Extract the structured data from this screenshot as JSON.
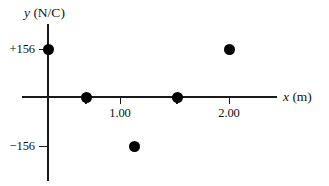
{
  "figure": {
    "background_color": "#ffffff",
    "ink_color": "#1a1a1a",
    "point_color": "#000000"
  },
  "axes": {
    "x_title_var": "x",
    "x_title_unit": " (m)",
    "y_title_var": "y",
    "y_title_unit": " (N/C)",
    "x_ticks": [
      {
        "label": "1.00",
        "value": 1.0,
        "px": 120
      },
      {
        "label": "2.00",
        "value": 2.0,
        "px": 229
      }
    ],
    "y_ticks": [
      {
        "label": "+156",
        "value": 156,
        "px": 49
      },
      {
        "label": "−156",
        "value": -156,
        "px": 146
      }
    ]
  },
  "chart_data": {
    "type": "scatter",
    "title": "",
    "subtitle": "",
    "xlabel": "x (m)",
    "ylabel": "y (N/C)",
    "xlim": [
      -0.33,
      2.85
    ],
    "ylim": [
      -250,
      232
    ],
    "grid": false,
    "legend": null,
    "x_tick_labels": [
      "1.00",
      "2.00"
    ],
    "y_tick_labels": [
      "+156",
      "−156"
    ],
    "x": [
      0.0,
      0.5,
      1.0,
      1.5,
      2.0
    ],
    "y": [
      156,
      0,
      -156,
      0,
      156
    ],
    "points": [
      {
        "x": 0.0,
        "y": 156,
        "px": 48,
        "py": 49
      },
      {
        "x": 0.5,
        "y": 0,
        "px": 86,
        "py": 97
      },
      {
        "x": 1.0,
        "y": -156,
        "px": 134,
        "py": 146
      },
      {
        "x": 1.5,
        "y": 0,
        "px": 177,
        "py": 97
      },
      {
        "x": 2.0,
        "y": 156,
        "px": 229,
        "py": 49
      }
    ],
    "annotations": []
  }
}
